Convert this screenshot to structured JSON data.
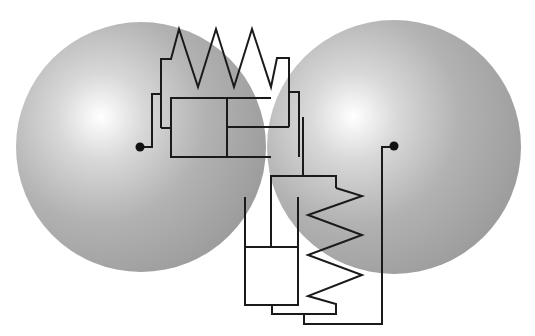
{
  "diagram": {
    "type": "mechanical-contact-model",
    "colors": {
      "background": "#ffffff",
      "sphere_highlight": "#ffffff",
      "sphere_mid": "#b4b4b4",
      "sphere_edge": "#9a9a9a",
      "line": "#1a1a1a",
      "node": "#111111"
    },
    "spheres": [
      {
        "id": "left-sphere",
        "cx": 141,
        "cy": 147,
        "r": 125,
        "hx": 100,
        "hy": 118
      },
      {
        "id": "right-sphere",
        "cx": 394,
        "cy": 147,
        "r": 127,
        "hx": 355,
        "hy": 118
      }
    ],
    "nodes": [
      {
        "id": "left-center-node",
        "x": 140,
        "y": 147
      },
      {
        "id": "right-center-node",
        "x": 394,
        "y": 146
      }
    ],
    "elements": {
      "top_spring": "161,128 161,59 171,59 179,29 198,87 216,29 234,87 252,29 271,87 277,58 289,58 289,127",
      "left_connector": "140,147 152,147 152,94 161,94",
      "spring_left_tail": "161,128 171,128",
      "damper1_housing": "271,98 171,98 171,157 271,157",
      "damper1_piston": "227,98 227,157",
      "damper1_rod": "227,127 289,127",
      "right_branch": "289,92 299,92 299,157",
      "coupling_rod": "303,117 303,176",
      "lower_frame": "271,247 271,176 336,176 336,188",
      "lower_spring": "336,188 362,196 308,215 362,235 308,255 362,275 308,296 336,304 336,314 272,314 272,305",
      "damper2_housing": "245,197 245,305 298,305 298,197",
      "damper2_piston": "245,247 298,247",
      "right_connector": "304,314 304,324 382,324 382,147 394,147"
    }
  }
}
